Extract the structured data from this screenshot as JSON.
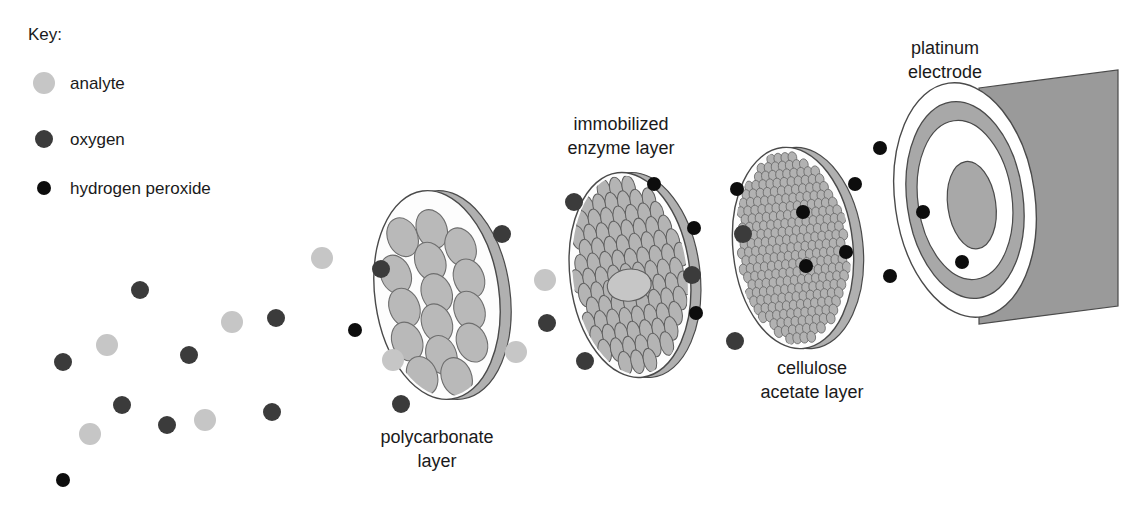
{
  "figure": {
    "kind": "biosensor-layer-diagram",
    "background": "#ffffff"
  },
  "key": {
    "title": "Key:",
    "items": [
      {
        "label": "analyte",
        "color": "#c6c6c6",
        "radius": 11,
        "icon": "circle-icon"
      },
      {
        "label": "oxygen",
        "color": "#3b3b3b",
        "radius": 9,
        "icon": "circle-icon"
      },
      {
        "label": "hydrogen peroxide",
        "color": "#0d0d0d",
        "radius": 7,
        "icon": "circle-icon"
      }
    ]
  },
  "labels": {
    "polycarbonate": {
      "line1": "polycarbonate",
      "line2": "layer"
    },
    "enzyme": {
      "line1": "immobilized",
      "line2": "enzyme layer"
    },
    "cellulose": {
      "line1": "cellulose",
      "line2": "acetate layer"
    },
    "platinum": {
      "line1": "platinum",
      "line2": "electrode"
    }
  },
  "colors": {
    "analyte": "#c6c6c6",
    "oxygen": "#3b3b3b",
    "peroxide": "#0d0d0d",
    "disc_fill": "#fdfdfd",
    "disc_edge": "#4a4a4a",
    "disc_rim": "#b0b0b0",
    "pore_fill": "#b9b9b9",
    "pore_edge": "#6e6e6e",
    "enzyme_fill": "#b4b4b4",
    "enzyme_edge": "#5f5f5f",
    "cellulose_fill": "#b2b2b2",
    "cellulose_edge": "#6b6b6b",
    "electrode_body": "#9a9a9a",
    "electrode_ring": "#a8a8a8",
    "electrode_white": "#ffffff",
    "text": "#1a1a1a"
  },
  "layers": [
    {
      "name": "polycarbonate-layer",
      "cx": 437,
      "cy": 295,
      "rx": 62,
      "ry": 105,
      "rot": -8,
      "rim_dx": 11,
      "pores": [
        [
          -26,
          -62
        ],
        [
          4,
          -66
        ],
        [
          30,
          -44
        ],
        [
          -2,
          -34
        ],
        [
          -38,
          -26
        ],
        [
          34,
          -12
        ],
        [
          0,
          -2
        ],
        [
          -34,
          8
        ],
        [
          30,
          20
        ],
        [
          -4,
          28
        ],
        [
          -36,
          42
        ],
        [
          28,
          52
        ],
        [
          -4,
          60
        ],
        [
          -26,
          78
        ],
        [
          8,
          84
        ]
      ],
      "pore_rx": 15,
      "pore_ry": 20,
      "pore_rot": -14
    },
    {
      "name": "immobilized-enzyme-layer",
      "cx": 630,
      "cy": 275,
      "rx": 60,
      "ry": 103,
      "rot": -7,
      "rim_dx": 10,
      "grid": {
        "cols": 9,
        "rows": 13,
        "ex": 6.5,
        "ey": 12,
        "gapx": 12.5,
        "gapy": 14.5
      },
      "blob": {
        "dx": -2,
        "dy": 10,
        "rx": 22,
        "ry": 16
      }
    },
    {
      "name": "cellulose-acetate-layer",
      "cx": 793,
      "cy": 248,
      "rx": 60,
      "ry": 101,
      "rot": -6,
      "rim_dx": 10,
      "grid": {
        "cols": 16,
        "rows": 23,
        "ex": 4.3,
        "ey": 5.6,
        "gapx": 7.1,
        "gapy": 8.2
      }
    }
  ],
  "electrode": {
    "name": "platinum-electrode",
    "face_cx": 965,
    "face_cy": 200,
    "rot": -8,
    "outer_rx": 70,
    "outer_ry": 118,
    "ring_rx": 58,
    "ring_ry": 99,
    "inner_white_rx": 47,
    "inner_white_ry": 80,
    "core_rx": 24,
    "core_ry": 44,
    "body_right": 1118,
    "body_skew": 18
  },
  "particles": {
    "free_left": [
      {
        "type": "peroxide",
        "x": 63,
        "y": 480
      },
      {
        "type": "analyte",
        "x": 90,
        "y": 434
      },
      {
        "type": "oxygen",
        "x": 167,
        "y": 425
      },
      {
        "type": "analyte",
        "x": 205,
        "y": 420
      },
      {
        "type": "oxygen",
        "x": 122,
        "y": 405
      },
      {
        "type": "oxygen",
        "x": 63,
        "y": 362
      },
      {
        "type": "analyte",
        "x": 107,
        "y": 345
      },
      {
        "type": "oxygen",
        "x": 272,
        "y": 412
      },
      {
        "type": "analyte",
        "x": 232,
        "y": 322
      },
      {
        "type": "oxygen",
        "x": 189,
        "y": 355
      },
      {
        "type": "oxygen",
        "x": 140,
        "y": 290
      },
      {
        "type": "analyte",
        "x": 322,
        "y": 258
      },
      {
        "type": "oxygen",
        "x": 276,
        "y": 318
      },
      {
        "type": "peroxide",
        "x": 355,
        "y": 330
      }
    ],
    "on_polycarbonate": [
      {
        "type": "oxygen",
        "x": 381,
        "y": 269
      },
      {
        "type": "analyte",
        "x": 393,
        "y": 360
      },
      {
        "type": "oxygen",
        "x": 401,
        "y": 404
      },
      {
        "type": "oxygen",
        "x": 502,
        "y": 234
      },
      {
        "type": "analyte",
        "x": 516,
        "y": 352
      }
    ],
    "between_poly_enzyme": [
      {
        "type": "analyte",
        "x": 545,
        "y": 280
      },
      {
        "type": "oxygen",
        "x": 547,
        "y": 323
      },
      {
        "type": "oxygen",
        "x": 585,
        "y": 361
      }
    ],
    "on_enzyme": [
      {
        "type": "oxygen",
        "x": 574,
        "y": 202
      },
      {
        "type": "peroxide",
        "x": 654,
        "y": 184
      },
      {
        "type": "peroxide",
        "x": 694,
        "y": 228
      },
      {
        "type": "oxygen",
        "x": 692,
        "y": 275
      },
      {
        "type": "peroxide",
        "x": 696,
        "y": 313
      }
    ],
    "between_enzyme_cellulose": [
      {
        "type": "oxygen",
        "x": 735,
        "y": 341
      },
      {
        "type": "peroxide",
        "x": 742,
        "y": 233
      }
    ],
    "on_cellulose": [
      {
        "type": "peroxide",
        "x": 737,
        "y": 189
      },
      {
        "type": "oxygen",
        "x": 743,
        "y": 234
      },
      {
        "type": "peroxide",
        "x": 803,
        "y": 212
      },
      {
        "type": "peroxide",
        "x": 806,
        "y": 266
      },
      {
        "type": "peroxide",
        "x": 855,
        "y": 184
      },
      {
        "type": "peroxide",
        "x": 846,
        "y": 252
      }
    ],
    "to_electrode": [
      {
        "type": "peroxide",
        "x": 880,
        "y": 148
      },
      {
        "type": "peroxide",
        "x": 890,
        "y": 276
      },
      {
        "type": "peroxide",
        "x": 923,
        "y": 212
      },
      {
        "type": "peroxide",
        "x": 962,
        "y": 262
      }
    ]
  }
}
